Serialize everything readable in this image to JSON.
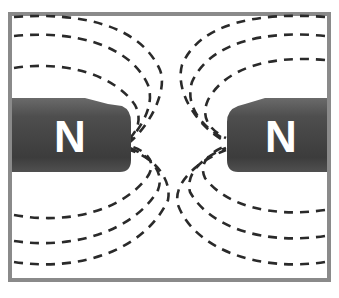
{
  "diagram": {
    "title": "",
    "frame": {
      "border_color": "#808080",
      "background": "#ffffff"
    },
    "magnets": [
      {
        "side": "left",
        "pole_label": "N",
        "color": "#4a4a4a"
      },
      {
        "side": "right",
        "pole_label": "N",
        "color": "#4a4a4a"
      }
    ],
    "field_lines": {
      "style": "dashed",
      "color": "#2a2a2a",
      "count_per_quadrant": 3,
      "behavior": "lines repel and curve away from the gap between poles"
    }
  }
}
